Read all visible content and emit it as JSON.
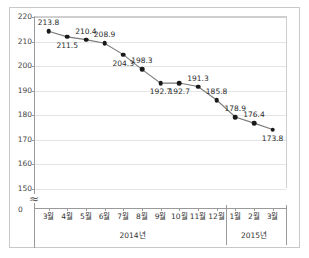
{
  "title": "",
  "chart_data": {
    "type": "line",
    "title": "",
    "xlabel": "",
    "ylabel": "",
    "categories": [
      "3월",
      "4월",
      "5월",
      "6월",
      "7월",
      "8월",
      "9월",
      "10월",
      "11월",
      "12월",
      "1월",
      "2월",
      "3월"
    ],
    "values": [
      213.8,
      211.5,
      210.4,
      208.9,
      204.3,
      198.3,
      192.7,
      192.7,
      191.3,
      185.8,
      178.9,
      176.4,
      173.8
    ],
    "ylim": [
      150,
      220
    ],
    "yticks": [
      "220",
      "210",
      "200",
      "190",
      "180",
      "170",
      "160",
      "150"
    ],
    "ytick_values": [
      220,
      210,
      200,
      190,
      180,
      170,
      160,
      150
    ],
    "axis_break_below": "150",
    "zero_label": "0",
    "grid": true,
    "legend": "none",
    "marker": "filled-circle",
    "line_color": "#7a7a7a",
    "marker_color": "#1a1a1a",
    "label_positions": [
      "above",
      "below",
      "above",
      "above",
      "below",
      "above",
      "below",
      "below",
      "above",
      "above",
      "above",
      "above",
      "below"
    ],
    "groups": [
      {
        "label": "2014년",
        "start_index": 0,
        "end_index": 9
      },
      {
        "label": "2015년",
        "start_index": 10,
        "end_index": 12
      }
    ]
  }
}
